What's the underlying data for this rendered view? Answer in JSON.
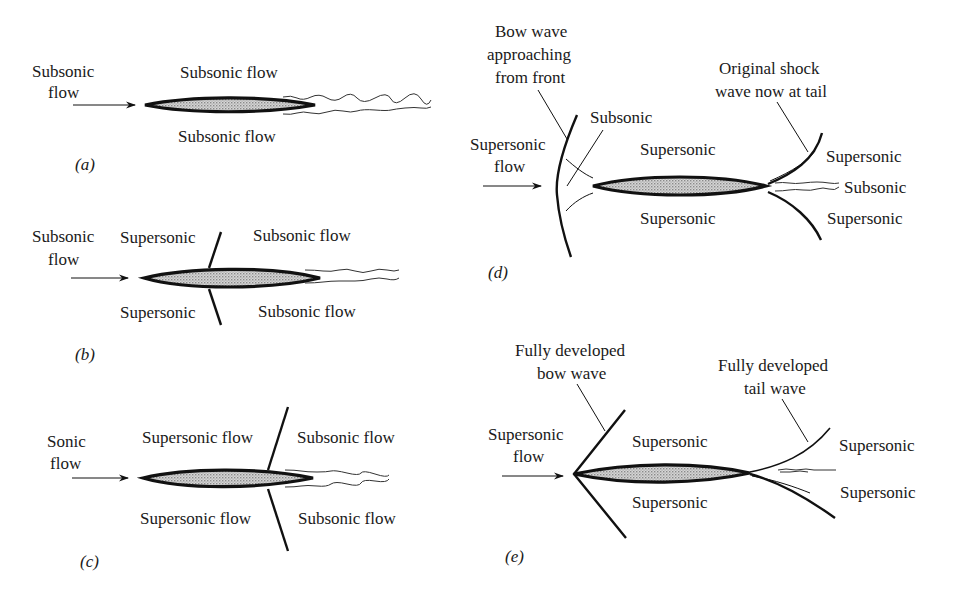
{
  "figure": {
    "panels": {
      "a": {
        "label": "(a)",
        "freestream": [
          "Subsonic",
          "flow"
        ],
        "upper": "Subsonic flow",
        "lower": "Subsonic flow"
      },
      "b": {
        "label": "(b)",
        "freestream": [
          "Subsonic",
          "flow"
        ],
        "upper_left": "Supersonic",
        "lower_left": "Supersonic",
        "upper_right": "Subsonic flow",
        "lower_right": "Subsonic flow"
      },
      "c": {
        "label": "(c)",
        "freestream": [
          "Sonic",
          "flow"
        ],
        "upper_left": "Supersonic flow",
        "lower_left": "Supersonic flow",
        "upper_right": "Subsonic flow",
        "lower_right": "Subsonic flow"
      },
      "d": {
        "label": "(d)",
        "freestream": [
          "Supersonic",
          "flow"
        ],
        "bow_callout": [
          "Bow wave",
          "approaching",
          "from front"
        ],
        "tail_callout": [
          "Original shock",
          "wave now at tail"
        ],
        "nose_region": "Subsonic",
        "upper": "Supersonic",
        "lower": "Supersonic",
        "tail_upper": "Supersonic",
        "tail_wake": "Subsonic",
        "tail_lower": "Supersonic"
      },
      "e": {
        "label": "(e)",
        "freestream": [
          "Supersonic",
          "flow"
        ],
        "bow_callout": [
          "Fully developed",
          "bow wave"
        ],
        "tail_callout": [
          "Fully developed",
          "tail wave"
        ],
        "upper": "Supersonic",
        "lower": "Supersonic",
        "tail_upper": "Supersonic",
        "tail_lower": "Supersonic"
      }
    }
  },
  "colors": {
    "ink": "#111111",
    "airfoil_fill": "#bdbdbd",
    "background": "#ffffff"
  }
}
